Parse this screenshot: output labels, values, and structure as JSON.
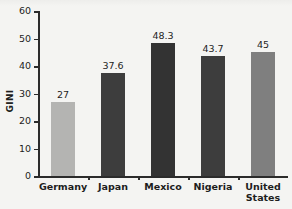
{
  "chart_data": {
    "type": "bar",
    "title": "",
    "xlabel": "",
    "ylabel": "GINI",
    "categories": [
      "Germany",
      "Japan",
      "Mexico",
      "Nigeria",
      "United States"
    ],
    "values": [
      27,
      37.6,
      48.3,
      43.7,
      45
    ],
    "value_labels": [
      "27",
      "37.6",
      "48.3",
      "43.7",
      "45"
    ],
    "ylim": [
      0,
      60
    ],
    "yticks": [
      0,
      10,
      20,
      30,
      40,
      50,
      60
    ],
    "ytick_labels": [
      "0",
      "10",
      "20",
      "30",
      "40",
      "50",
      "60"
    ],
    "grid": false,
    "legend": false,
    "bar_colors": [
      "#b4b4b2",
      "#3d3d3d",
      "#333333",
      "#3d3d3d",
      "#7f7f7f"
    ]
  },
  "axes": {
    "axis_color": "#2b2b2b",
    "background": "#f4f4f2",
    "text_color": "#1d1d1d"
  }
}
